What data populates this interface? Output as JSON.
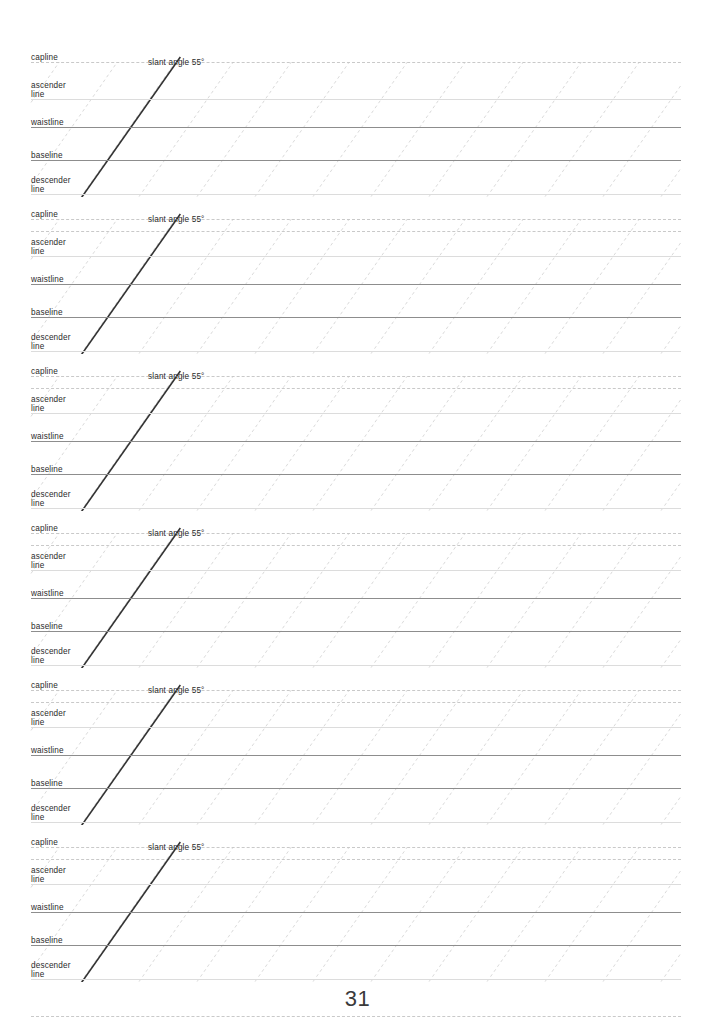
{
  "page": {
    "number": "31",
    "width": 715,
    "height": 1036,
    "background": "#ffffff"
  },
  "worksheet": {
    "kind": "calligraphy-guide-sheet",
    "block_count": 6,
    "block_tops": [
      50,
      207,
      364,
      521,
      678,
      835
    ],
    "grid": {
      "left": 31,
      "right": 681,
      "slant_angle_degrees": 55,
      "slant_spacing_px": 58,
      "slant_color": "#dadada",
      "bold_slant_color": "#333333",
      "dashed_color": "#c9c9c9",
      "light_color": "#dcdcdc",
      "strong_color": "#8d8d8d"
    },
    "guide_lines": [
      {
        "name": "capline",
        "label": "capline",
        "offset": 12,
        "weight": "dashed"
      },
      {
        "name": "ascender-line",
        "label": "ascender\nline",
        "offset": 49,
        "weight": "light"
      },
      {
        "name": "waistline",
        "label": "waistline",
        "offset": 77,
        "weight": "strong"
      },
      {
        "name": "baseline",
        "label": "baseline",
        "offset": 110,
        "weight": "strong"
      },
      {
        "name": "descender-line",
        "label": "descender\nline",
        "offset": 144,
        "weight": "light"
      }
    ],
    "bottom_line": {
      "name": "bottom-line",
      "offset": 181,
      "weight": "dashed"
    },
    "slant_caption": "slant angle 55°",
    "slant_caption_x": 148,
    "slant_caption_offset": -4,
    "blocks": [
      {
        "id": 1,
        "name": "practice-block-1"
      },
      {
        "id": 2,
        "name": "practice-block-2"
      },
      {
        "id": 3,
        "name": "practice-block-3"
      },
      {
        "id": 4,
        "name": "practice-block-4"
      },
      {
        "id": 5,
        "name": "practice-block-5"
      },
      {
        "id": 6,
        "name": "practice-block-6"
      }
    ]
  }
}
